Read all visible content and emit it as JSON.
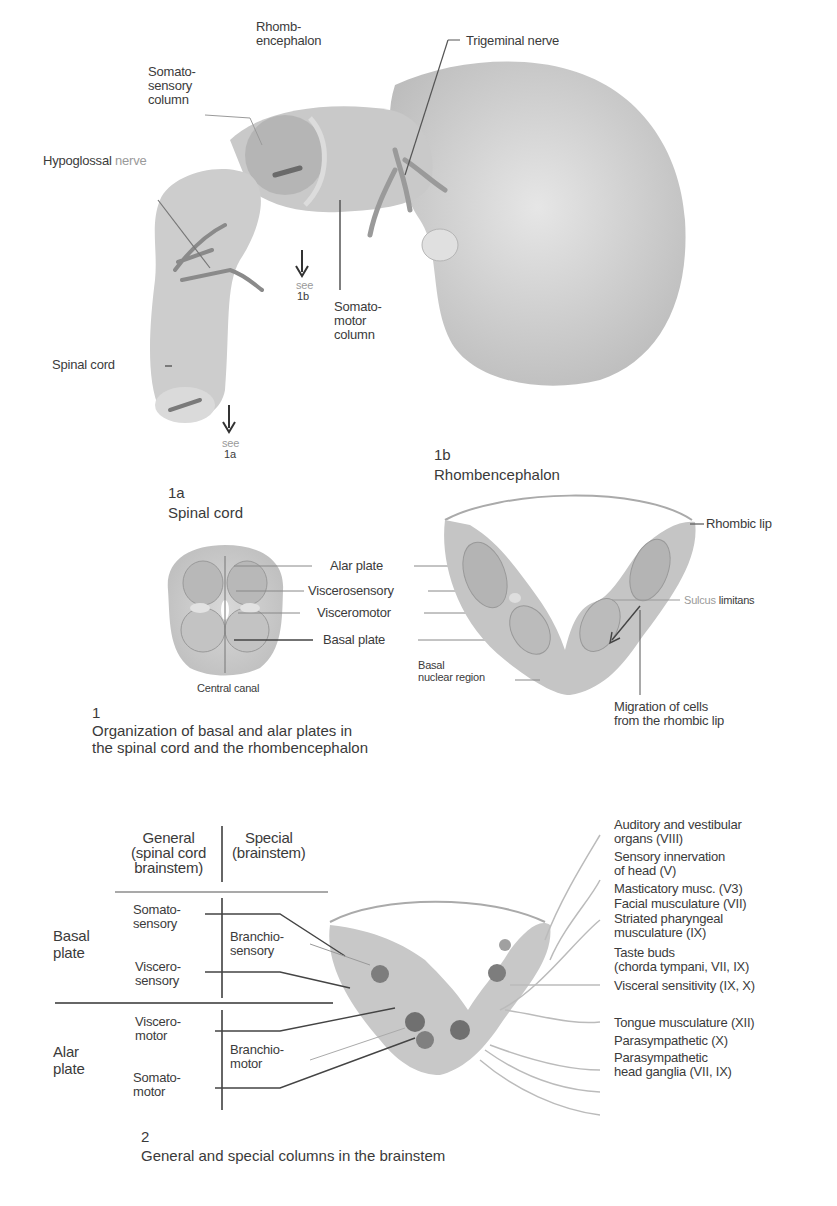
{
  "figure_1_embryo": {
    "labels": {
      "rhombencephalon": "Rhomb-\nencephalon",
      "trigeminal_nerve": "Trigeminal nerve",
      "somatosensory_column": "Somato-\nsensory\ncolumn",
      "hypoglossal_nerve_main": "Hypoglossal",
      "hypoglossal_nerve_suffix": "nerve",
      "spinal_cord": "Spinal cord",
      "somatomotor_column": "Somato-\nmotor\ncolumn",
      "see_1b_word": "see",
      "see_1b_ref": "1b",
      "see_1a_word": "see",
      "see_1a_ref": "1a"
    }
  },
  "figure_1a": {
    "number": "1a",
    "title": "Spinal cord",
    "labels": {
      "alar_plate": "Alar plate",
      "viscerosensory": "Viscerosensory",
      "visceromotor": "Visceromotor",
      "basal_plate": "Basal plate",
      "central_canal": "Central canal"
    }
  },
  "figure_1b": {
    "number": "1b",
    "title": "Rhombencephalon",
    "labels": {
      "rhombic_lip": "Rhombic lip",
      "sulcus_prefix": "Sulcus",
      "sulcus_suffix": "limitans",
      "basal_nuclear_region": "Basal\nnuclear region",
      "migration": "Migration of cells\nfrom the rhombic lip"
    }
  },
  "figure_1_caption": {
    "number": "1",
    "text": "Organization of basal and alar plates in\nthe spinal cord and the rhombencephalon"
  },
  "figure_2": {
    "table": {
      "header_general": "General\n(spinal cord\nbrainstem)",
      "header_special": "Special\n(brainstem)",
      "rows": [
        {
          "plate": "Basal\nplate",
          "general": [
            "Somato-\nsensory",
            "Viscero-\nsensory"
          ],
          "special": "Branchio-\nsensory"
        },
        {
          "plate": "Alar\nplate",
          "general": [
            "Viscero-\nmotor",
            "Somato-\nmotor"
          ],
          "special": "Branchio-\nmotor"
        }
      ]
    },
    "right_labels": [
      "Auditory and vestibular\norgans (VIII)",
      "Sensory innervation\nof head (V)",
      "Masticatory musc. (V3)",
      "Facial musculature (VII)",
      "Striated pharyngeal\nmusculature (IX)",
      "Taste buds\n(chorda tympani, VII, IX)",
      "Visceral sensitivity (IX, X)",
      "Tongue musculature (XII)",
      "Parasympathetic (X)",
      "Parasympathetic\nhead ganglia (VII, IX)"
    ],
    "caption_number": "2",
    "caption_text": "General and special columns in the brainstem"
  },
  "colors": {
    "tissue": "#c8c8c8",
    "tissue_dark": "#a9a9a9",
    "nucleus": "#7a7a7a",
    "line": "#555555",
    "text": "#3a3a3a"
  }
}
